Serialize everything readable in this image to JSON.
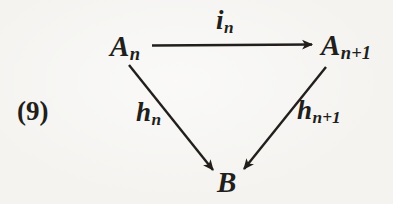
{
  "equation_number": "(9)",
  "colors": {
    "ink": "#211e1b",
    "paper": "#f4f3f0"
  },
  "diagram": {
    "type": "commutative-triangle",
    "nodes": {
      "top_left": {
        "base": "A",
        "sub": "n"
      },
      "top_right": {
        "base": "A",
        "sub": "n+1"
      },
      "bottom": {
        "base": "B",
        "sub": ""
      }
    },
    "edge_labels": {
      "top": {
        "base": "i",
        "sub": "n"
      },
      "left": {
        "base": "h",
        "sub": "n"
      },
      "right": {
        "base": "h",
        "sub": "n+1"
      }
    }
  }
}
